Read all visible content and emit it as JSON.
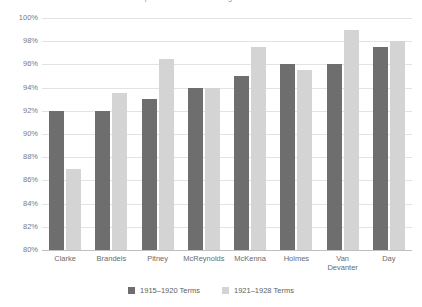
{
  "chart_data": {
    "type": "bar",
    "title": "Supreme Court Justice Agreement Rates",
    "categories": [
      "Clarke",
      "Brandeis",
      "Pitney",
      "McReynolds",
      "McKenna",
      "Holmes",
      "Van\nDevanter",
      "Day"
    ],
    "series": [
      {
        "name": "1915–1920 Terms",
        "color": "#6e6e6e",
        "values": [
          92.0,
          92.0,
          93.0,
          94.0,
          95.0,
          96.0,
          96.0,
          97.5
        ]
      },
      {
        "name": "1921–1928 Terms",
        "color": "#d4d4d4",
        "values": [
          87.0,
          93.5,
          96.5,
          94.0,
          97.5,
          95.5,
          99.0,
          98.0
        ]
      }
    ],
    "xlabel": "",
    "ylabel": "",
    "ylim": [
      80,
      100
    ],
    "ytick_values": [
      80,
      82,
      84,
      86,
      88,
      90,
      92,
      94,
      96,
      98,
      100
    ],
    "ytick_labels": [
      "80%",
      "82%",
      "84%",
      "86%",
      "88%",
      "90%",
      "92%",
      "94%",
      "96%",
      "98%",
      "100%"
    ],
    "grid": true,
    "legend_position": "bottom"
  }
}
